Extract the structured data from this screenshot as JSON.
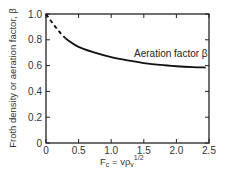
{
  "chart_data": {
    "type": "line",
    "title": "",
    "xlabel": "F_c = v ρ_v^(1/2)",
    "xlabel_parts": {
      "main": "F",
      "sub": "c",
      "eq": " = vρ",
      "sub2": "v",
      "sup": "1/2"
    },
    "ylabel": "Froth density or aeration factor, β",
    "xlim": [
      0,
      2.5
    ],
    "ylim": [
      0,
      1.0
    ],
    "x_ticks": [
      "0",
      "0.5",
      "1.0",
      "1.5",
      "2.0",
      "2.5"
    ],
    "y_ticks": [
      "0",
      "0.2",
      "0.4",
      "0.6",
      "0.8",
      "1.0"
    ],
    "grid": false,
    "legend": null,
    "annotations": [
      {
        "text": "Aeration factor β",
        "x": 1.35,
        "y": 0.69
      }
    ],
    "series": [
      {
        "name": "Aeration factor β (extrapolated)",
        "style": "dashed",
        "x": [
          0.0,
          0.1,
          0.2,
          0.3
        ],
        "y": [
          1.0,
          0.93,
          0.865,
          0.81
        ]
      },
      {
        "name": "Aeration factor β",
        "style": "solid",
        "x": [
          0.3,
          0.5,
          0.75,
          1.0,
          1.25,
          1.5,
          1.75,
          2.0,
          2.25,
          2.45
        ],
        "y": [
          0.81,
          0.745,
          0.7,
          0.665,
          0.64,
          0.62,
          0.605,
          0.595,
          0.588,
          0.585
        ]
      }
    ]
  }
}
